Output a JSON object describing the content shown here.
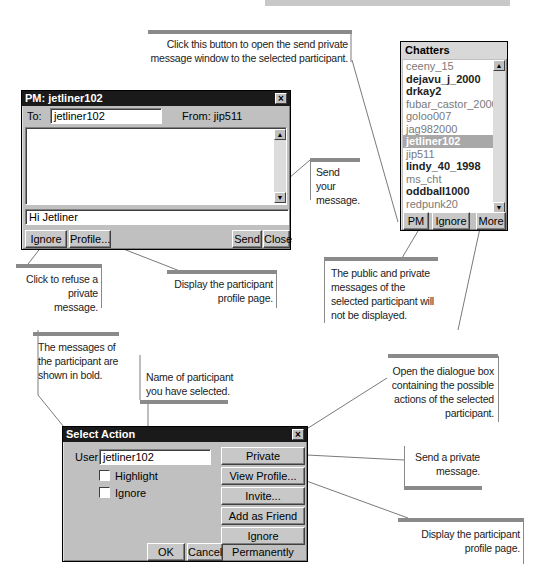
{
  "pm_window": {
    "title": "PM: jetliner102",
    "to_label": "To:",
    "to_value": "jetliner102",
    "from_label": "From: jip511",
    "message_input": "Hi Jetliner",
    "buttons": {
      "ignore": "Ignore",
      "profile": "Profile...",
      "send": "Send",
      "close": "Close"
    }
  },
  "chatters": {
    "title": "Chatters",
    "items": [
      {
        "name": "ceeny_15",
        "style": "light"
      },
      {
        "name": "dejavu_j_2000",
        "style": "bold"
      },
      {
        "name": "drkay2",
        "style": "bold"
      },
      {
        "name": "fubar_castor_2000",
        "style": "light"
      },
      {
        "name": "goloo007",
        "style": "light"
      },
      {
        "name": "jag982000",
        "style": "light"
      },
      {
        "name": "jetliner102",
        "style": "sel"
      },
      {
        "name": "jip511",
        "style": "light"
      },
      {
        "name": "lindy_40_1998",
        "style": "bold"
      },
      {
        "name": "ms_cht",
        "style": "light"
      },
      {
        "name": "oddball1000",
        "style": "bold"
      },
      {
        "name": "redpunk20",
        "style": "light"
      },
      {
        "name": "richtoria",
        "style": "bold"
      }
    ],
    "buttons": {
      "pm": "PM",
      "ignore": "Ignore",
      "more": "More"
    }
  },
  "select_action": {
    "title": "Select Action",
    "user_label": "User:",
    "user_value": "jetliner102",
    "highlight_label": "Highlight",
    "ignore_label": "Ignore",
    "buttons": {
      "private_message": "Private Message...",
      "view_profile": "View Profile...",
      "invite": "Invite...",
      "add_friend": "Add as Friend",
      "ignore_permanently": "Ignore Permanently",
      "ok": "OK",
      "cancel": "Cancel"
    }
  },
  "callouts": {
    "pm_button": "Click this button to open the send private message window to the selected participant.",
    "send": "Send your message.",
    "refuse": "Click to refuse a private message.",
    "profile": "Display the participant profile page.",
    "ignore": "The public and private messages of the selected participant will not be displayed.",
    "bold": "The messages of the participant are shown in bold.",
    "name": "Name of participant you have selected.",
    "more": "Open the dialogue box containing the possible actions of the selected participant.",
    "private_msg": "Send a private message.",
    "view_profile": "Display the participant profile page."
  }
}
